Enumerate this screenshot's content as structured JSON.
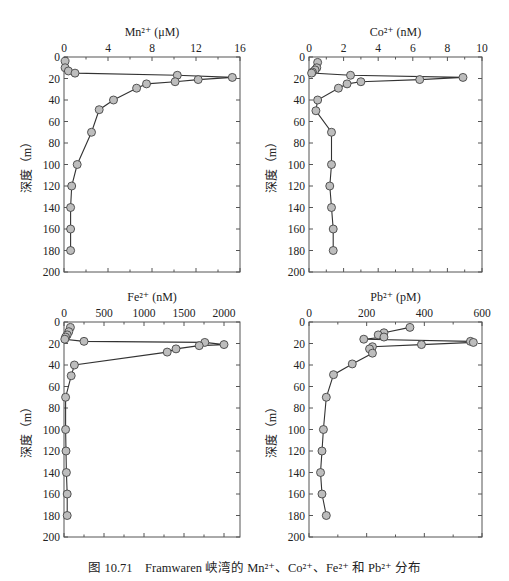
{
  "figure": {
    "caption_prefix": "图 10.71",
    "caption_text": "Framwaren 峡湾的 Mn²⁺、Co²⁺、Fe²⁺ 和 Pb²⁺ 分布",
    "line_color": "#333333",
    "marker_fill": "#bdbdbd",
    "marker_stroke": "#444444",
    "axis_color": "#555555"
  },
  "chart_data": [
    {
      "type": "line",
      "title": "Mn²⁺ (μM)",
      "xlabel": "Mn²⁺ (μM)",
      "ylabel": "深度（m）",
      "xlim": [
        0,
        16
      ],
      "xticks": [
        0,
        4,
        8,
        12,
        16
      ],
      "ylim": [
        200,
        0
      ],
      "yticks": [
        0,
        20,
        40,
        60,
        80,
        100,
        120,
        140,
        160,
        180,
        200
      ],
      "grid": false,
      "x": [
        0.1,
        0.1,
        0.4,
        1.0,
        10.3,
        15.3,
        12.2,
        10.1,
        7.5,
        6.6,
        4.5,
        3.2,
        2.5,
        1.2,
        0.7,
        0.6,
        0.6,
        0.6
      ],
      "depth": [
        4,
        10,
        13,
        15,
        17,
        19,
        21,
        23,
        25,
        29,
        40,
        49,
        70,
        100,
        120,
        140,
        160,
        180
      ]
    },
    {
      "type": "line",
      "title": "Co²⁺ (nM)",
      "xlabel": "Co²⁺ (nM)",
      "ylabel": "深度（m）",
      "xlim": [
        0,
        10
      ],
      "xticks": [
        0,
        2,
        4,
        6,
        8,
        10
      ],
      "ylim": [
        200,
        0
      ],
      "yticks": [
        0,
        20,
        40,
        60,
        80,
        100,
        120,
        140,
        160,
        180,
        200
      ],
      "grid": false,
      "x": [
        0.5,
        0.45,
        0.35,
        0.2,
        0.15,
        2.4,
        8.9,
        6.4,
        3.0,
        2.2,
        1.7,
        0.5,
        0.4,
        1.3,
        1.3,
        1.2,
        1.3,
        1.4,
        1.4
      ],
      "depth": [
        5,
        10,
        12,
        14,
        15,
        17,
        19,
        21,
        23,
        25,
        29,
        40,
        50,
        70,
        100,
        120,
        140,
        160,
        180
      ]
    },
    {
      "type": "line",
      "title": "Fe²⁺ (nM)",
      "xlabel": "Fe²⁺ (nM)",
      "ylabel": "深度（m）",
      "xlim": [
        0,
        2200
      ],
      "xticks": [
        0,
        500,
        1000,
        1500,
        2000
      ],
      "ylim": [
        200,
        0
      ],
      "yticks": [
        0,
        20,
        40,
        60,
        80,
        100,
        120,
        140,
        160,
        180,
        200
      ],
      "grid": false,
      "x": [
        80,
        60,
        40,
        20,
        10,
        250,
        1760,
        2000,
        1690,
        1400,
        1290,
        130,
        90,
        20,
        20,
        25,
        30,
        40,
        40
      ],
      "depth": [
        5,
        9,
        12,
        14,
        16,
        18,
        19,
        21,
        22,
        25,
        28,
        40,
        50,
        70,
        100,
        120,
        140,
        160,
        180
      ]
    },
    {
      "type": "line",
      "title": "Pb²⁺ (pM)",
      "xlabel": "Pb²⁺ (pM)",
      "ylabel": "深度（m）",
      "xlim": [
        0,
        600
      ],
      "xticks": [
        0,
        200,
        400,
        600
      ],
      "ylim": [
        200,
        0
      ],
      "yticks": [
        0,
        20,
        40,
        60,
        80,
        100,
        120,
        140,
        160,
        180,
        200
      ],
      "grid": false,
      "x": [
        350,
        260,
        240,
        260,
        190,
        560,
        570,
        390,
        220,
        210,
        220,
        150,
        85,
        60,
        50,
        45,
        40,
        45,
        60
      ],
      "depth": [
        5,
        10,
        12,
        14,
        16,
        18,
        19,
        21,
        23,
        25,
        29,
        39,
        49,
        70,
        100,
        120,
        140,
        160,
        180
      ]
    }
  ]
}
